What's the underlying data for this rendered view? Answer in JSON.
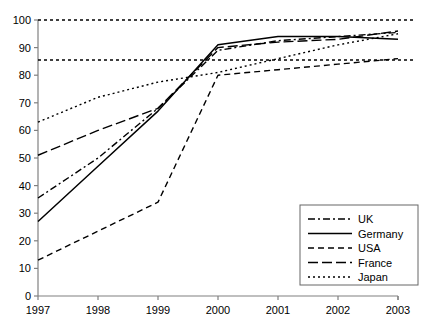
{
  "chart_data": {
    "type": "line",
    "title": "",
    "subtitle": "",
    "xlabel": "",
    "ylabel": "",
    "x": [
      1997,
      1998,
      1999,
      2000,
      2001,
      2002,
      2003
    ],
    "categories": [
      "1997",
      "1998",
      "1999",
      "2000",
      "2001",
      "2002",
      "2003"
    ],
    "xlim": [
      1997,
      2003
    ],
    "ylim": [
      0,
      100
    ],
    "yticks": [
      0,
      10,
      20,
      30,
      40,
      50,
      60,
      70,
      80,
      90,
      100
    ],
    "ytick_labels": [
      "0",
      "10",
      "20",
      "30",
      "40",
      "50",
      "60",
      "70",
      "80",
      "90",
      "100"
    ],
    "xticks": [
      1997,
      1998,
      1999,
      2000,
      2001,
      2002,
      2003
    ],
    "xtick_labels": [
      "1997",
      "1998",
      "1999",
      "2000",
      "2001",
      "2002",
      "2003"
    ],
    "grid": false,
    "legend_position": "bottom-right",
    "reference_lines": [
      {
        "name": "upper-reference-line",
        "value": 100,
        "style": "dotted"
      },
      {
        "name": "lower-reference-line",
        "value": 85.5,
        "style": "dotted"
      }
    ],
    "series": [
      {
        "name": "UK",
        "style": "dash-dot",
        "dasharray": "7,3,2,3",
        "values": [
          35.5,
          50,
          68,
          89,
          92.5,
          94,
          95.5
        ]
      },
      {
        "name": "Germany",
        "style": "solid",
        "dasharray": "none",
        "values": [
          27,
          47,
          67,
          91,
          94,
          94,
          93
        ]
      },
      {
        "name": "USA",
        "style": "dashed",
        "dasharray": "6,4",
        "values": [
          13,
          23.5,
          34,
          80,
          82,
          84,
          86
        ]
      },
      {
        "name": "France",
        "style": "long-dash",
        "dasharray": "10,4",
        "values": [
          51,
          60,
          68,
          90,
          92,
          93,
          96
        ]
      },
      {
        "name": "Japan",
        "style": "dotted",
        "dasharray": "2,3",
        "values": [
          63,
          72,
          77.5,
          81,
          86,
          91,
          95
        ]
      }
    ]
  },
  "legend": {
    "entries": [
      {
        "label": "UK",
        "style": "dash-dot"
      },
      {
        "label": "Germany",
        "style": "solid"
      },
      {
        "label": "USA",
        "style": "dashed"
      },
      {
        "label": "France",
        "style": "long-dash"
      },
      {
        "label": "Japan",
        "style": "dotted"
      }
    ]
  },
  "colors": {
    "line": "#000000",
    "axis": "#808080",
    "text": "#000000",
    "background": "#ffffff",
    "legend_border": "#666666"
  }
}
